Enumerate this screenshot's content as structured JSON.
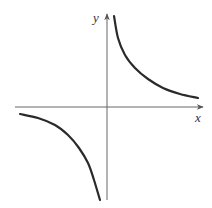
{
  "chart_data": {
    "type": "line",
    "title": "",
    "xlabel": "x",
    "ylabel": "y",
    "function": "y = k/x (k > 0), rectangular hyperbola",
    "grid": false,
    "legend": null,
    "axis_ticks": "none",
    "series": [
      {
        "name": "branch-quadrant-I",
        "points_px": [
          [
            114,
            16
          ],
          [
            118,
            38
          ],
          [
            125,
            55
          ],
          [
            135,
            68
          ],
          [
            148,
            79
          ],
          [
            163,
            88
          ],
          [
            180,
            94
          ],
          [
            198,
            98
          ]
        ]
      },
      {
        "name": "branch-quadrant-III",
        "points_px": [
          [
            20,
            114
          ],
          [
            38,
            118
          ],
          [
            55,
            125
          ],
          [
            68,
            135
          ],
          [
            79,
            148
          ],
          [
            88,
            163
          ],
          [
            94,
            180
          ],
          [
            100,
            200
          ]
        ]
      }
    ]
  },
  "axes": {
    "x_label": "x",
    "y_label": "y",
    "axis_color": "#555555",
    "curve_color": "#2a2a2a",
    "origin_px": [
      107,
      107
    ]
  }
}
